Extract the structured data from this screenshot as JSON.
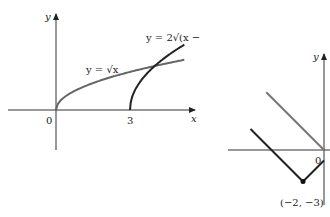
{
  "chart_data": [
    {
      "type": "line",
      "title": "",
      "xlabel": "x",
      "ylabel": "y",
      "origin_label": "0",
      "x_ticks": [
        {
          "value": 3,
          "label": "3"
        }
      ],
      "xlim": [
        -2.5,
        5.5
      ],
      "ylim": [
        -1.5,
        3.2
      ],
      "grid": false,
      "series": [
        {
          "name": "y = √x",
          "label": "y = √x",
          "color": "#666666",
          "function": "sqrt(x)",
          "domain": [
            0,
            5.2
          ]
        },
        {
          "name": "y = 2√(x − 3)",
          "label": "y = 2√(x − 3)",
          "color": "#222222",
          "function": "2*sqrt(x-3)",
          "domain": [
            3,
            5.2
          ]
        }
      ]
    },
    {
      "type": "line",
      "title": "",
      "xlabel": "",
      "ylabel": "y",
      "origin_label": "0",
      "xlim": [
        -7,
        1
      ],
      "ylim": [
        -4,
        5
      ],
      "grid": false,
      "series": [
        {
          "name": "y = |x|",
          "color": "#777777",
          "points": [
            [
              -5.5,
              5.5
            ],
            [
              0,
              0
            ]
          ]
        },
        {
          "name": "y = |x + 2| - 3",
          "color": "#222222",
          "points": [
            [
              -7,
              2
            ],
            [
              -2,
              -3
            ],
            [
              0,
              -1
            ]
          ]
        }
      ],
      "annotations": [
        {
          "point": [
            -2,
            -3
          ],
          "label": "(−2, −3)"
        }
      ]
    }
  ]
}
